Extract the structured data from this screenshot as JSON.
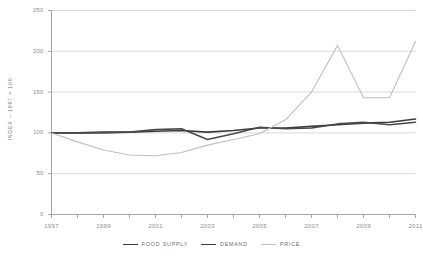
{
  "chart_data": {
    "type": "line",
    "title": "",
    "xlabel": "",
    "ylabel": "INDEX – 1997 = 100",
    "xlim": [
      1997,
      2011
    ],
    "ylim": [
      0,
      250
    ],
    "grid": true,
    "legend_position": "bottom",
    "x": [
      1997,
      1998,
      1999,
      2000,
      2001,
      2002,
      2003,
      2004,
      2005,
      2006,
      2007,
      2008,
      2009,
      2010,
      2011
    ],
    "y_ticks": [
      "0",
      "50",
      "100",
      "150",
      "200",
      "250"
    ],
    "y_tick_values": [
      0,
      50,
      100,
      150,
      200,
      250
    ],
    "x_ticks": [
      "1997",
      "1999",
      "2001",
      "2003",
      "2005",
      "2007",
      "2009",
      "2011"
    ],
    "x_tick_values": [
      1997,
      1999,
      2001,
      2003,
      2005,
      2007,
      2009,
      2011
    ],
    "x_minor_ticks": [
      1998,
      2000,
      2002,
      2004,
      2006,
      2008,
      2010
    ],
    "series": [
      {
        "name": "FOOD SUPPLY",
        "color": "#3b3b3b",
        "width": 1.6,
        "values": [
          100,
          100,
          101,
          101,
          102,
          103,
          101,
          103,
          106,
          106,
          108,
          110,
          112,
          113,
          117
        ]
      },
      {
        "name": "DEMAND",
        "color": "#4a4a4a",
        "width": 1.6,
        "values": [
          100,
          100,
          100,
          101,
          104,
          105,
          92,
          99,
          107,
          105,
          106,
          111,
          113,
          110,
          113
        ]
      },
      {
        "name": "PRICE",
        "color": "#bfbfbf",
        "width": 1.1,
        "values": [
          100,
          89,
          79,
          73,
          72,
          76,
          85,
          92,
          99,
          116,
          150,
          207,
          143,
          143,
          212
        ]
      }
    ]
  },
  "legend": {
    "items": [
      {
        "label": "FOOD SUPPLY",
        "style": "thick"
      },
      {
        "label": "DEMAND",
        "style": "thick"
      },
      {
        "label": "PRICE",
        "style": "thin"
      }
    ]
  },
  "colors": {
    "background": "#ffffff",
    "axis": "#9a9a9a",
    "grid": "#c9c9c9",
    "text": "#8d8d8d",
    "food_supply": "#3b3b3b",
    "demand": "#4a4a4a",
    "price": "#bfbfbf"
  }
}
